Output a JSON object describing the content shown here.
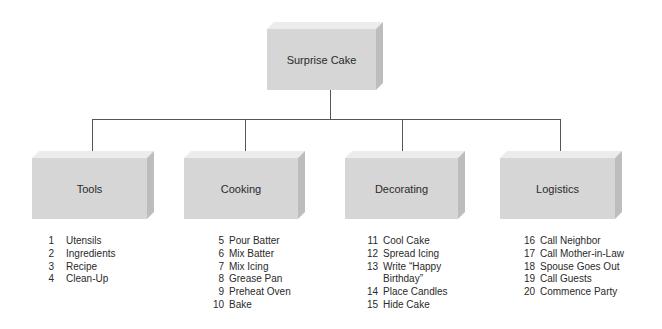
{
  "diagram": {
    "type": "hierarchy",
    "root": {
      "label": "Surprise Cake"
    },
    "children": [
      {
        "label": "Tools",
        "tasks": [
          {
            "num": "1",
            "label": "Utensils"
          },
          {
            "num": "2",
            "label": "Ingredients"
          },
          {
            "num": "3",
            "label": "Recipe"
          },
          {
            "num": "4",
            "label": "Clean-Up"
          }
        ]
      },
      {
        "label": "Cooking",
        "tasks": [
          {
            "num": "5",
            "label": "Pour Batter"
          },
          {
            "num": "6",
            "label": "Mix Batter"
          },
          {
            "num": "7",
            "label": "Mix Icing"
          },
          {
            "num": "8",
            "label": "Grease Pan"
          },
          {
            "num": "9",
            "label": "Preheat Oven"
          },
          {
            "num": "10",
            "label": "Bake"
          }
        ]
      },
      {
        "label": "Decorating",
        "tasks": [
          {
            "num": "11",
            "label": "Cool Cake"
          },
          {
            "num": "12",
            "label": "Spread Icing"
          },
          {
            "num": "13",
            "label": "Write “Happy Birthday”"
          },
          {
            "num": "14",
            "label": "Place Candles"
          },
          {
            "num": "15",
            "label": "Hide Cake"
          }
        ]
      },
      {
        "label": "Logistics",
        "tasks": [
          {
            "num": "16",
            "label": "Call Neighbor"
          },
          {
            "num": "17",
            "label": "Call Mother-in-Law"
          },
          {
            "num": "18",
            "label": "Spouse Goes Out"
          },
          {
            "num": "19",
            "label": "Call Guests"
          },
          {
            "num": "20",
            "label": "Commence Party"
          }
        ]
      }
    ],
    "colors": {
      "box_front": "#d6d6d6",
      "box_top": "#ececec",
      "box_side": "#bdbdbd",
      "connector": "#555555"
    }
  }
}
